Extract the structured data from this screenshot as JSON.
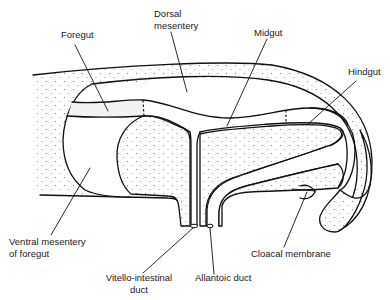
{
  "diagram": {
    "labels": {
      "foregut": "Foregut",
      "dorsal_mesentery_1": "Dorsal",
      "dorsal_mesentery_2": "mesentery",
      "midgut": "Midgut",
      "hindgut": "Hindgut",
      "ventral_mesentery_1": "Ventral mesentery",
      "ventral_mesentery_2": "of foregut",
      "vitello_intestinal_1": "Vitello-intestinal",
      "vitello_intestinal_2": "duct",
      "allantoic_duct": "Allantoic duct",
      "cloacal_membrane": "Cloacal membrane"
    },
    "colors": {
      "line": "#111111",
      "background": "#ffffff",
      "stipple": "#6a6a6a"
    }
  }
}
